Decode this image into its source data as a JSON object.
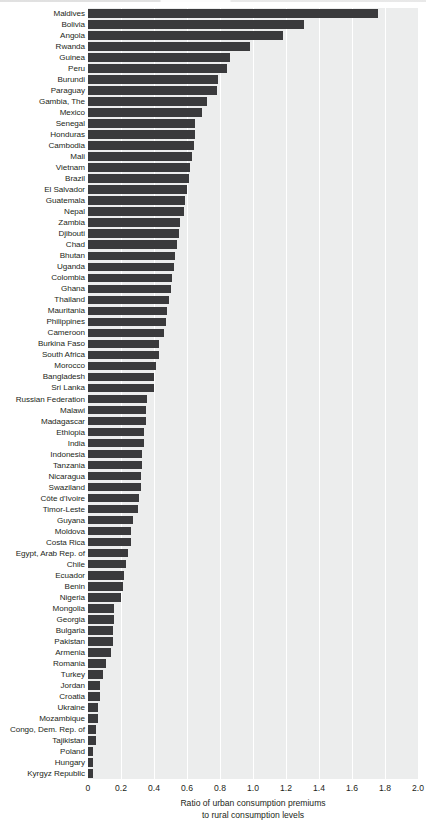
{
  "chart_data": {
    "type": "bar",
    "orientation": "horizontal",
    "title": "",
    "xlabel": "Ratio of urban consumption premiums to rural consumption levels",
    "xlabel_line1": "Ratio of urban consumption premiums",
    "xlabel_line2": "to rural consumption levels",
    "ylabel": "",
    "xlim": [
      0,
      2.0
    ],
    "xticks": [
      0,
      0.2,
      0.4,
      0.6,
      0.8,
      1.0,
      1.2,
      1.4,
      1.6,
      1.8,
      2.0
    ],
    "xtick_labels": [
      "0",
      "0.2",
      "0.4",
      "0.6",
      "0.8",
      "1.0",
      "1.2",
      "1.4",
      "1.6",
      "1.8",
      "2.0"
    ],
    "grid": true,
    "grid_axis": "x",
    "legend": "none",
    "bar_color": "#3a3a3c",
    "plot_background": "#eceded",
    "gridline_color": "#ffffff",
    "categories": [
      "Maldives",
      "Bolivia",
      "Angola",
      "Rwanda",
      "Guinea",
      "Peru",
      "Burundi",
      "Paraguay",
      "Gambia, The",
      "Mexico",
      "Senegal",
      "Honduras",
      "Cambodia",
      "Mali",
      "Vietnam",
      "Brazil",
      "El Salvador",
      "Guatemala",
      "Nepal",
      "Zambia",
      "Djibouti",
      "Chad",
      "Bhutan",
      "Uganda",
      "Colombia",
      "Ghana",
      "Thailand",
      "Mauritania",
      "Philippines",
      "Cameroon",
      "Burkina Faso",
      "South Africa",
      "Morocco",
      "Bangladesh",
      "Sri Lanka",
      "Russian Federation",
      "Malawi",
      "Madagascar",
      "Ethiopia",
      "India",
      "Indonesia",
      "Tanzania",
      "Nicaragua",
      "Swaziland",
      "Côte d'Ivoire",
      "Timor-Leste",
      "Guyana",
      "Moldova",
      "Costa Rica",
      "Egypt, Arab Rep. of",
      "Chile",
      "Ecuador",
      "Benin",
      "Nigeria",
      "Mongolia",
      "Georgia",
      "Bulgaria",
      "Pakistan",
      "Armenia",
      "Romania",
      "Turkey",
      "Jordan",
      "Croatia",
      "Ukraine",
      "Mozambique",
      "Congo, Dem. Rep. of",
      "Tajikistan",
      "Poland",
      "Hungary",
      "Kyrgyz Republic"
    ],
    "values": [
      1.76,
      1.31,
      1.18,
      0.98,
      0.86,
      0.84,
      0.79,
      0.78,
      0.72,
      0.69,
      0.65,
      0.65,
      0.64,
      0.63,
      0.62,
      0.61,
      0.6,
      0.59,
      0.58,
      0.56,
      0.55,
      0.54,
      0.53,
      0.52,
      0.51,
      0.5,
      0.49,
      0.48,
      0.47,
      0.46,
      0.43,
      0.43,
      0.41,
      0.4,
      0.4,
      0.36,
      0.35,
      0.35,
      0.34,
      0.34,
      0.33,
      0.33,
      0.32,
      0.32,
      0.31,
      0.3,
      0.27,
      0.26,
      0.26,
      0.24,
      0.23,
      0.22,
      0.21,
      0.2,
      0.16,
      0.16,
      0.15,
      0.15,
      0.14,
      0.11,
      0.09,
      0.07,
      0.07,
      0.06,
      0.06,
      0.05,
      0.05,
      0.03,
      0.03,
      0.03
    ]
  }
}
